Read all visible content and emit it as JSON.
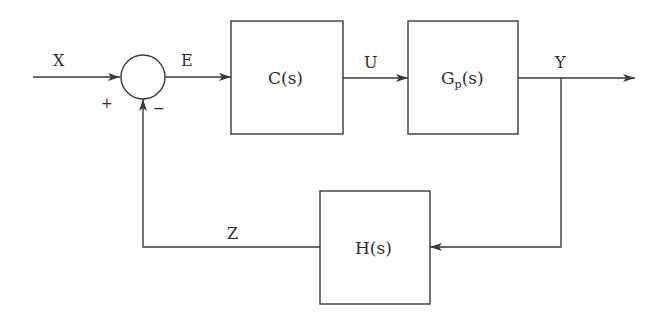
{
  "diagram": {
    "type": "feedback-control-block-diagram",
    "colors": {
      "stroke": "#3a3a3a",
      "text": "#2b2b2b",
      "background": "#ffffff"
    },
    "signals": {
      "input": "X",
      "error": "E",
      "control": "U",
      "output": "Y",
      "feedback": "Z"
    },
    "summing_junction": {
      "plus_sign": "+",
      "minus_sign": "−"
    },
    "blocks": {
      "controller": {
        "main": "C(s)"
      },
      "plant": {
        "main": "G",
        "sub": "p",
        "suffix": "(s)"
      },
      "sensor": {
        "main": "H(s)"
      }
    }
  }
}
